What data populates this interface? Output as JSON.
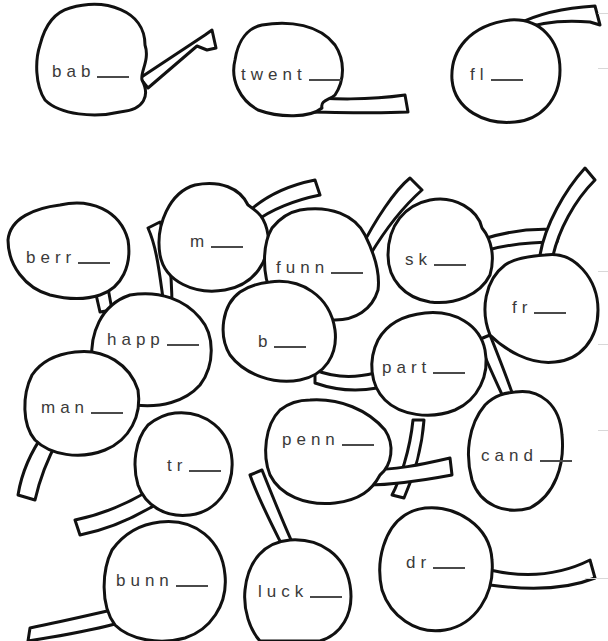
{
  "worksheet": {
    "instruction": "Add y to finish each word",
    "ending_hint": "y",
    "cherries": [
      {
        "id": "bab",
        "stem": "bab",
        "x": 42,
        "y": 62
      },
      {
        "id": "twent",
        "stem": "twent",
        "x": 240,
        "y": 65
      },
      {
        "id": "fl",
        "stem": "fl",
        "x": 470,
        "y": 65
      },
      {
        "id": "berr",
        "stem": "berr",
        "x": 26,
        "y": 248
      },
      {
        "id": "m",
        "stem": "m",
        "x": 190,
        "y": 232
      },
      {
        "id": "funn",
        "stem": "funn",
        "x": 276,
        "y": 258
      },
      {
        "id": "sk",
        "stem": "sk",
        "x": 405,
        "y": 250
      },
      {
        "id": "fr",
        "stem": "fr",
        "x": 512,
        "y": 298
      },
      {
        "id": "happ",
        "stem": "happ",
        "x": 107,
        "y": 330
      },
      {
        "id": "b",
        "stem": "b",
        "x": 258,
        "y": 332
      },
      {
        "id": "part",
        "stem": "part",
        "x": 382,
        "y": 358
      },
      {
        "id": "man",
        "stem": "man",
        "x": 41,
        "y": 398
      },
      {
        "id": "penn",
        "stem": "penn",
        "x": 282,
        "y": 430
      },
      {
        "id": "cand",
        "stem": "cand",
        "x": 481,
        "y": 446
      },
      {
        "id": "tr",
        "stem": "tr",
        "x": 167,
        "y": 456
      },
      {
        "id": "bunn",
        "stem": "bunn",
        "x": 116,
        "y": 571
      },
      {
        "id": "luck",
        "stem": "luck",
        "x": 258,
        "y": 582
      },
      {
        "id": "dr",
        "stem": "dr",
        "x": 406,
        "y": 553
      }
    ]
  },
  "colors": {
    "ink": "#111111",
    "text": "#3a3a3a",
    "background": "#ffffff",
    "faint_rule": "#d8d8d8"
  }
}
